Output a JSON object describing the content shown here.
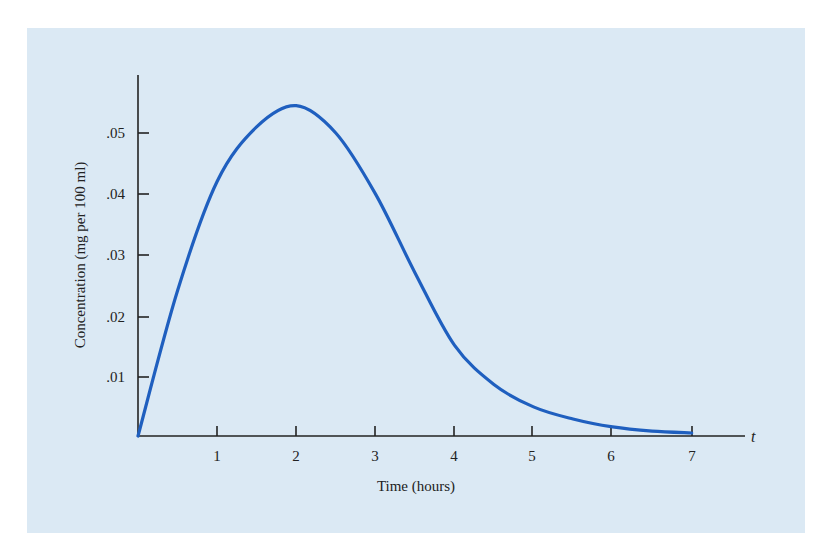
{
  "colors": {
    "background": "#dbe9f4",
    "curve": "#1f5fbf",
    "axis": "#222222"
  },
  "chart_data": {
    "type": "line",
    "title": "",
    "xlabel": "Time (hours)",
    "ylabel": "Concentration (mg per 100 ml)",
    "x_axis_variable": "t",
    "xlim": [
      0,
      7.6
    ],
    "ylim": [
      0,
      0.058
    ],
    "grid": false,
    "legend": null,
    "x_ticks": [
      "1",
      "2",
      "3",
      "4",
      "5",
      "6",
      "7"
    ],
    "y_ticks": [
      ".01",
      ".02",
      ".03",
      ".04",
      ".05"
    ],
    "series": [
      {
        "name": "Concentration",
        "x": [
          0,
          0.5,
          1,
          1.5,
          2,
          2.5,
          3,
          3.5,
          4,
          4.5,
          5,
          5.5,
          6,
          6.5,
          7
        ],
        "values": [
          0,
          0.024,
          0.042,
          0.051,
          0.0545,
          0.05,
          0.04,
          0.027,
          0.015,
          0.0085,
          0.0048,
          0.0028,
          0.0015,
          0.0008,
          0.0005
        ]
      }
    ]
  }
}
